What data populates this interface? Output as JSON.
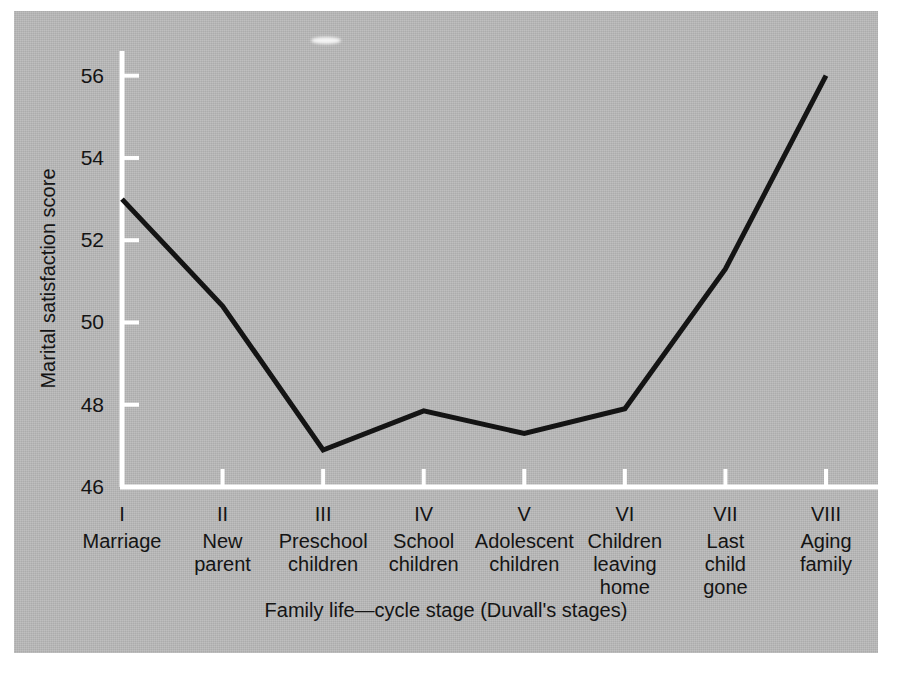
{
  "figure": {
    "background_color": "#b9b9b9",
    "page_color": "#ffffff",
    "axis_color": "#ffffff",
    "line_color": "#141414",
    "text_color": "#141414"
  },
  "chart_data": {
    "type": "line",
    "title": "",
    "xlabel": "Family life—cycle stage (Duvall's stages)",
    "ylabel": "Marital satisfaction score",
    "grid": false,
    "legend": false,
    "ylim": [
      46,
      56.6
    ],
    "yticks": [
      46,
      48,
      50,
      52,
      54,
      56
    ],
    "ytick_labels": [
      "46",
      "48",
      "50",
      "52",
      "54",
      "56"
    ],
    "categories": [
      "I",
      "II",
      "III",
      "IV",
      "V",
      "VI",
      "VII",
      "VIII"
    ],
    "category_labels": [
      [
        "Marriage"
      ],
      [
        "New",
        "parent"
      ],
      [
        "Preschool",
        "children"
      ],
      [
        "School",
        "children"
      ],
      [
        "Adolescent",
        "children"
      ],
      [
        "Children",
        "leaving",
        "home"
      ],
      [
        "Last",
        "child",
        "gone"
      ],
      [
        "Aging",
        "family"
      ]
    ],
    "values": [
      53.0,
      50.4,
      46.9,
      47.85,
      47.3,
      47.9,
      51.3,
      56.0
    ],
    "series": [
      {
        "name": "Marital satisfaction score",
        "values": [
          53.0,
          50.4,
          46.9,
          47.85,
          47.3,
          47.9,
          51.3,
          56.0
        ]
      }
    ]
  }
}
